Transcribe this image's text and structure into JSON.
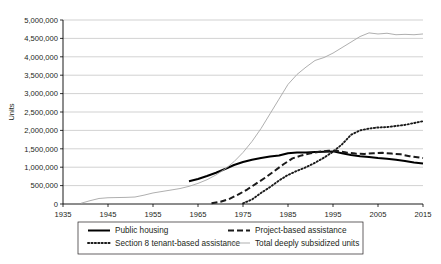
{
  "chart_data": {
    "type": "line",
    "title": "",
    "xlabel": "",
    "ylabel": "Units",
    "xlim": [
      1935,
      2015
    ],
    "ylim": [
      0,
      5000000
    ],
    "xticks": [
      1935,
      1945,
      1955,
      1965,
      1975,
      1985,
      1995,
      2005,
      2015
    ],
    "yticks": [
      0,
      500000,
      1000000,
      1500000,
      2000000,
      2500000,
      3000000,
      3500000,
      4000000,
      4500000,
      5000000
    ],
    "ytick_labels": [
      "0",
      "500,000",
      "1,000,000",
      "1,500,000",
      "2,000,000",
      "2,500,000",
      "3,000,000",
      "3,500,000",
      "4,000,000",
      "4,500,000",
      "5,000,000"
    ],
    "xtick_labels": [
      "1935",
      "1945",
      "1955",
      "1965",
      "1975",
      "1985",
      "1995",
      "2005",
      "2015"
    ],
    "grid": true,
    "legend_position": "bottom",
    "series": [
      {
        "name": "Public housing",
        "style": "solid-thick",
        "color": "#000000",
        "x": [
          1963,
          1965,
          1967,
          1969,
          1971,
          1973,
          1975,
          1977,
          1979,
          1981,
          1983,
          1985,
          1987,
          1989,
          1991,
          1993,
          1995,
          1997,
          1999,
          2001,
          2003,
          2005,
          2007,
          2009,
          2011,
          2013,
          2015
        ],
        "values": [
          620000,
          680000,
          760000,
          850000,
          950000,
          1060000,
          1140000,
          1200000,
          1250000,
          1290000,
          1320000,
          1380000,
          1400000,
          1400000,
          1410000,
          1420000,
          1430000,
          1380000,
          1330000,
          1300000,
          1280000,
          1250000,
          1230000,
          1200000,
          1170000,
          1130000,
          1100000
        ]
      },
      {
        "name": "Project-based assistance",
        "style": "dashed-thick",
        "color": "#1a1a1a",
        "x": [
          1968,
          1970,
          1972,
          1974,
          1976,
          1978,
          1980,
          1982,
          1984,
          1986,
          1988,
          1990,
          1992,
          1994,
          1996,
          1998,
          2000,
          2002,
          2004,
          2006,
          2008,
          2010,
          2012,
          2015
        ],
        "values": [
          20000,
          60000,
          140000,
          260000,
          400000,
          560000,
          720000,
          900000,
          1080000,
          1240000,
          1320000,
          1380000,
          1420000,
          1450000,
          1440000,
          1400000,
          1370000,
          1360000,
          1380000,
          1390000,
          1370000,
          1350000,
          1300000,
          1250000
        ]
      },
      {
        "name": "Section 8 tenant-based assistance",
        "style": "dotted",
        "color": "#1a1a1a",
        "x": [
          1975,
          1977,
          1979,
          1981,
          1983,
          1985,
          1987,
          1989,
          1991,
          1993,
          1995,
          1997,
          1999,
          2001,
          2003,
          2005,
          2007,
          2009,
          2011,
          2013,
          2015
        ],
        "values": [
          20000,
          120000,
          300000,
          460000,
          640000,
          790000,
          900000,
          1000000,
          1120000,
          1260000,
          1420000,
          1620000,
          1880000,
          2000000,
          2050000,
          2080000,
          2090000,
          2120000,
          2150000,
          2200000,
          2250000
        ]
      },
      {
        "name": "Total deeply subsidized units",
        "style": "solid-thin",
        "color": "#a6a6a6",
        "x": [
          1939,
          1941,
          1943,
          1945,
          1947,
          1949,
          1951,
          1953,
          1955,
          1957,
          1959,
          1961,
          1963,
          1965,
          1967,
          1969,
          1971,
          1973,
          1975,
          1977,
          1979,
          1981,
          1983,
          1985,
          1987,
          1989,
          1991,
          1993,
          1995,
          1997,
          1999,
          2001,
          2003,
          2005,
          2007,
          2009,
          2011,
          2013,
          2015
        ],
        "values": [
          20000,
          90000,
          150000,
          170000,
          175000,
          180000,
          190000,
          240000,
          300000,
          340000,
          380000,
          420000,
          480000,
          560000,
          660000,
          790000,
          950000,
          1150000,
          1400000,
          1700000,
          2050000,
          2450000,
          2850000,
          3250000,
          3520000,
          3720000,
          3900000,
          3980000,
          4100000,
          4250000,
          4400000,
          4550000,
          4650000,
          4620000,
          4640000,
          4600000,
          4610000,
          4600000,
          4620000
        ]
      }
    ]
  },
  "legend": {
    "items": [
      {
        "label": "Public housing"
      },
      {
        "label": "Project-based assistance"
      },
      {
        "label": "Section 8 tenant-based assistance"
      },
      {
        "label": "Total deeply subsidized units"
      }
    ]
  }
}
